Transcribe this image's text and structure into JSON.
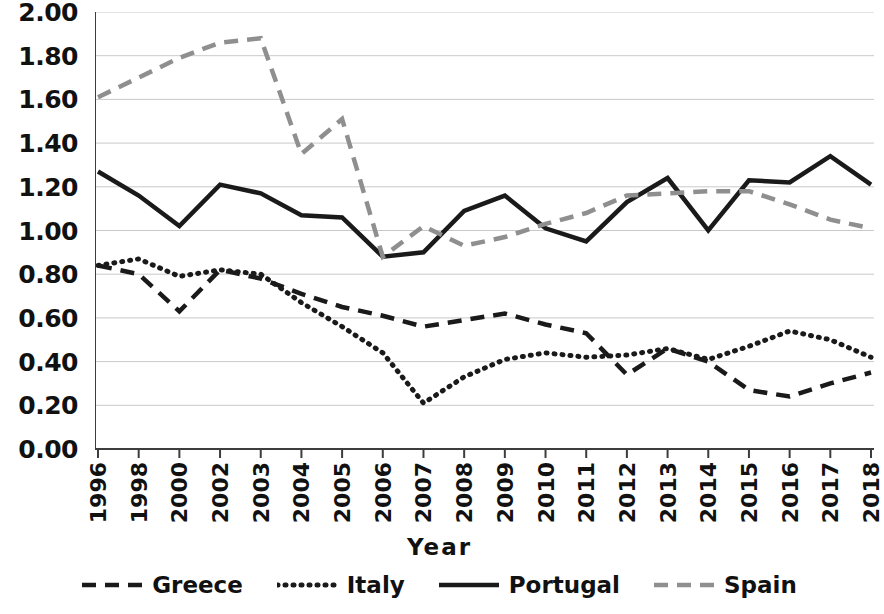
{
  "chart_data": {
    "type": "line",
    "title": "",
    "xlabel": "Year",
    "ylabel": "",
    "grid": true,
    "legend_position": "bottom",
    "categories": [
      "1996",
      "1998",
      "2000",
      "2002",
      "2003",
      "2004",
      "2005",
      "2006",
      "2007",
      "2008",
      "2009",
      "2010",
      "2011",
      "2012",
      "2013",
      "2014",
      "2015",
      "2016",
      "2017",
      "2018"
    ],
    "ylim": [
      0.0,
      2.0
    ],
    "ytick_labels": [
      "0.00",
      "0.20",
      "0.40",
      "0.60",
      "0.80",
      "1.00",
      "1.20",
      "1.40",
      "1.60",
      "1.80",
      "2.00"
    ],
    "ytick_values": [
      0.0,
      0.2,
      0.4,
      0.6,
      0.8,
      1.0,
      1.2,
      1.4,
      1.6,
      1.8,
      2.0
    ],
    "series": [
      {
        "name": "Greece",
        "style": "dashed",
        "color": "#1a1a1a",
        "values": [
          0.84,
          0.8,
          0.63,
          0.82,
          0.78,
          0.71,
          0.65,
          0.61,
          0.56,
          0.59,
          0.62,
          0.57,
          0.53,
          0.34,
          0.46,
          0.4,
          0.27,
          0.24,
          0.3,
          0.35
        ]
      },
      {
        "name": "Italy",
        "style": "dotted",
        "color": "#1a1a1a",
        "values": [
          0.84,
          0.87,
          0.79,
          0.82,
          0.8,
          0.67,
          0.56,
          0.44,
          0.21,
          0.33,
          0.41,
          0.44,
          0.42,
          0.43,
          0.46,
          0.41,
          0.47,
          0.54,
          0.5,
          0.42
        ]
      },
      {
        "name": "Portugal",
        "style": "solid",
        "color": "#1a1a1a",
        "values": [
          1.27,
          1.16,
          1.02,
          1.21,
          1.17,
          1.07,
          1.06,
          0.88,
          0.9,
          1.09,
          1.16,
          1.01,
          0.95,
          1.13,
          1.24,
          1.0,
          1.23,
          1.22,
          1.34,
          1.21
        ]
      },
      {
        "name": "Spain",
        "style": "dashed",
        "color": "#8f8f8f",
        "values": [
          1.61,
          1.7,
          1.79,
          1.86,
          1.88,
          1.35,
          1.51,
          0.88,
          1.02,
          0.93,
          0.97,
          1.03,
          1.08,
          1.16,
          1.17,
          1.18,
          1.18,
          1.12,
          1.05,
          1.01
        ]
      }
    ]
  },
  "axis": {
    "x_title": "Year"
  },
  "legend": {
    "items": [
      {
        "label": "Greece"
      },
      {
        "label": "Italy"
      },
      {
        "label": "Portugal"
      },
      {
        "label": "Spain"
      }
    ]
  }
}
